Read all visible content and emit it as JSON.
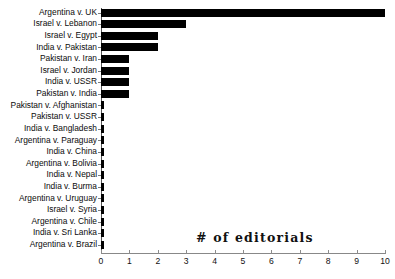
{
  "chart_data": {
    "type": "bar",
    "orientation": "horizontal",
    "title": "",
    "xlabel": "",
    "ylabel": "",
    "annotation": "# of editorials",
    "xlim": [
      0,
      10
    ],
    "grid": false,
    "legend": null,
    "xticks": [
      "0",
      "1",
      "2",
      "3",
      "4",
      "5",
      "6",
      "7",
      "8",
      "9",
      "10"
    ],
    "bar_color": "#000000",
    "axis_color": "#888888",
    "categories": [
      "Argentina v. UK",
      "Israel v. Lebanon",
      "Israel v. Egypt",
      "India v. Pakistan",
      "Pakistan v. Iran",
      "Israel v. Jordan",
      "India v. USSR",
      "Pakistan v. India",
      "Pakistan v. Afghanistan",
      "Pakistan v. USSR",
      "India v. Bangladesh",
      "Argentina v. Paraguay",
      "India v. China",
      "Argentina v. Bolivia",
      "India v. Nepal",
      "India v. Burma",
      "Argentina v. Uruguay",
      "Israel v. Syria",
      "Argentina v. Chile",
      "India v. Sri Lanka",
      "Argentina v. Brazil"
    ],
    "values": [
      10,
      3,
      2,
      2,
      1,
      1,
      1,
      1,
      0.1,
      0.1,
      0.1,
      0.1,
      0.1,
      0.1,
      0.1,
      0.1,
      0.1,
      0.1,
      0.1,
      0.1,
      0.1
    ]
  }
}
